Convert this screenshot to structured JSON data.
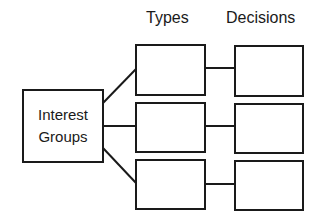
{
  "diagram": {
    "source": {
      "line1": "Interest",
      "line2": "Groups"
    },
    "columns": [
      {
        "header": "Types",
        "boxes": [
          "",
          "",
          ""
        ]
      },
      {
        "header": "Decisions",
        "boxes": [
          "",
          "",
          ""
        ]
      }
    ],
    "connections": [
      {
        "from": "Interest Groups",
        "to": "Types box 1"
      },
      {
        "from": "Interest Groups",
        "to": "Types box 2"
      },
      {
        "from": "Interest Groups",
        "to": "Types box 3"
      },
      {
        "from": "Types box 1",
        "to": "Decisions box 1"
      },
      {
        "from": "Types box 2",
        "to": "Decisions box 2"
      },
      {
        "from": "Types box 3",
        "to": "Decisions box 3"
      }
    ],
    "colors": {
      "stroke": "#1a1a1a",
      "background": "#ffffff"
    }
  }
}
